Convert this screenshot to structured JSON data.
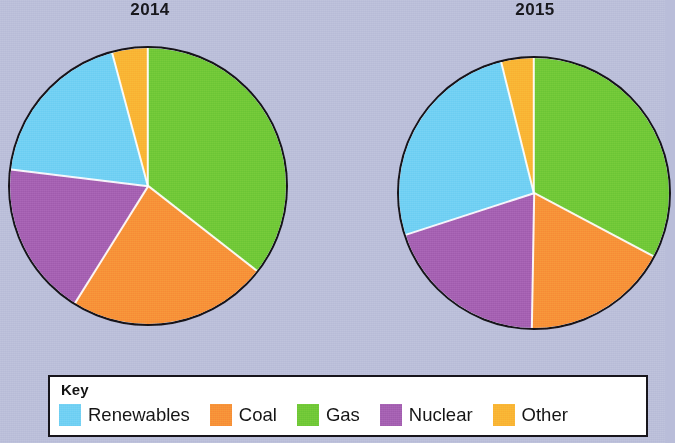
{
  "background_color": "#b9bdd9",
  "charts": [
    {
      "title": "2014",
      "center_x": 148,
      "center_y": 186,
      "radius": 140,
      "slices": [
        {
          "label": "Gas",
          "color": "#6ec736",
          "start_deg": 0,
          "end_deg": 128
        },
        {
          "label": "Coal",
          "color": "#f78f37",
          "start_deg": 128,
          "end_deg": 212
        },
        {
          "label": "Nuclear",
          "color": "#a35eb0",
          "start_deg": 212,
          "end_deg": 277
        },
        {
          "label": "Renewables",
          "color": "#6ecff3",
          "start_deg": 277,
          "end_deg": 345
        },
        {
          "label": "Other",
          "color": "#f9b333",
          "start_deg": 345,
          "end_deg": 360
        }
      ]
    },
    {
      "title": "2015",
      "center_x": 534,
      "center_y": 193,
      "radius": 137,
      "slices": [
        {
          "label": "Gas",
          "color": "#6ec736",
          "start_deg": 0,
          "end_deg": 118
        },
        {
          "label": "Coal",
          "color": "#f78f37",
          "start_deg": 118,
          "end_deg": 181
        },
        {
          "label": "Nuclear",
          "color": "#a35eb0",
          "start_deg": 181,
          "end_deg": 252
        },
        {
          "label": "Renewables",
          "color": "#6ecff3",
          "start_deg": 252,
          "end_deg": 346
        },
        {
          "label": "Other",
          "color": "#f9b333",
          "start_deg": 346,
          "end_deg": 360
        }
      ]
    }
  ],
  "legend": {
    "title": "Key",
    "items": [
      {
        "label": "Renewables",
        "color": "#6ecff3"
      },
      {
        "label": "Coal",
        "color": "#f78f37"
      },
      {
        "label": "Gas",
        "color": "#6ec736"
      },
      {
        "label": "Nuclear",
        "color": "#a35eb0"
      },
      {
        "label": "Other",
        "color": "#f9b333"
      }
    ]
  },
  "chart_data": {
    "type": "pie",
    "categories": [
      "Renewables",
      "Coal",
      "Gas",
      "Nuclear",
      "Other"
    ],
    "colors": [
      "#6ecff3",
      "#f78f37",
      "#6ec736",
      "#a35eb0",
      "#f9b333"
    ],
    "units": "percent of total",
    "legend_position": "bottom",
    "grid": false,
    "series": [
      {
        "name": "2014",
        "values": [
          19,
          23,
          36,
          18,
          4
        ],
        "slice_order": [
          "Gas",
          "Coal",
          "Nuclear",
          "Renewables",
          "Other"
        ],
        "slice_angles_deg": [
          128,
          84,
          65,
          68,
          15
        ]
      },
      {
        "name": "2015",
        "values": [
          26,
          17,
          33,
          20,
          4
        ],
        "slice_order": [
          "Gas",
          "Coal",
          "Nuclear",
          "Renewables",
          "Other"
        ],
        "slice_angles_deg": [
          118,
          63,
          71,
          94,
          14
        ]
      }
    ]
  }
}
